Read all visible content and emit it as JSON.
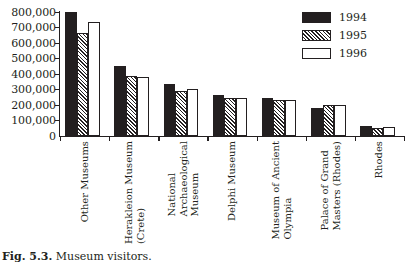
{
  "figure": {
    "caption_id": "Fig. 5.3.",
    "caption_text": "Museum visitors."
  },
  "legend": {
    "position": "top-right",
    "items": [
      {
        "label": "1994",
        "swatch": "solid-black"
      },
      {
        "label": "1995",
        "swatch": "diagonal-hatch"
      },
      {
        "label": "1996",
        "swatch": "white-outline"
      }
    ]
  },
  "chart_data": {
    "type": "bar",
    "title": "Museum visitors",
    "xlabel": "",
    "ylabel": "",
    "ylim": [
      0,
      800000
    ],
    "grid": false,
    "legend_position": "top-right",
    "ytick_labels": [
      "800,000",
      "700,000",
      "600,000",
      "500,000",
      "400,000",
      "300,000",
      "200,000",
      "100,000",
      "0"
    ],
    "ytick_values": [
      800000,
      700000,
      600000,
      500000,
      400000,
      300000,
      200000,
      100000,
      0
    ],
    "categories": [
      "Other Museums",
      "Herakleion Museum (Crete)",
      "National Archaeological Museum",
      "Delphi Museum",
      "Museum of Ancient Olympia",
      "Palace of Grand Masters (Rhodes)",
      "Rhodes"
    ],
    "category_lines": [
      [
        "Other Museums"
      ],
      [
        "Herakleion Museum",
        "(Crete)"
      ],
      [
        "National",
        "Archaeological",
        "Museum"
      ],
      [
        "Delphi Museum"
      ],
      [
        "Museum of Ancient",
        "Olympia"
      ],
      [
        "Palace of Grand",
        "Masters (Rhodes)"
      ],
      [
        "Rhodes"
      ]
    ],
    "series": [
      {
        "name": "1994",
        "values": [
          800000,
          450000,
          333000,
          265000,
          245000,
          178000,
          62000
        ]
      },
      {
        "name": "1995",
        "values": [
          665000,
          390000,
          288000,
          248000,
          230000,
          198000,
          52000
        ]
      },
      {
        "name": "1996",
        "values": [
          735000,
          378000,
          302000,
          245000,
          232000,
          202000,
          55000
        ]
      }
    ]
  },
  "colors": {
    "ink": "#231f20",
    "paper": "#ffffff"
  }
}
